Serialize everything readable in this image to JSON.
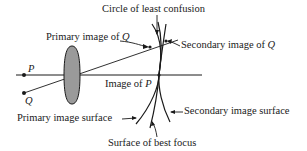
{
  "diagram": {
    "points": {
      "P": "P",
      "Q": "Q"
    },
    "labels": {
      "circle_least_confusion": "Circle of least confusion",
      "primary_image_of_q_prefix": "Primary image of ",
      "primary_image_of_q_var": "Q",
      "secondary_image_of_q_prefix": "Secondary image of ",
      "secondary_image_of_q_var": "Q",
      "image_of_p_prefix": "Image of ",
      "image_of_p_var": "P",
      "primary_image_surface": "Primary image surface",
      "secondary_image_surface": "Secondary image surface",
      "surface_best_focus": "Surface of best focus"
    },
    "colors": {
      "line": "#1a1a1a",
      "lens_fill": "#9a9a9a",
      "background": "#ffffff"
    }
  }
}
